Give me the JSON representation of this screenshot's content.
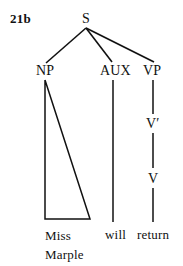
{
  "figure": {
    "example_number": "21b",
    "sentence": "Miss Marple will return",
    "ink_color": "#111111",
    "background_color": "#ffffff"
  },
  "tree": {
    "type": "phrase-structure-tree",
    "root": {
      "label": "S",
      "x": 86,
      "y": 18
    },
    "nodes": [
      {
        "id": "S",
        "label": "S",
        "x": 86,
        "y": 18,
        "level": 0
      },
      {
        "id": "NP",
        "label": "NP",
        "x": 45,
        "y": 70,
        "level": 1
      },
      {
        "id": "AUX",
        "label": "AUX",
        "x": 113,
        "y": 70,
        "level": 1
      },
      {
        "id": "VP",
        "label": "VP",
        "x": 153,
        "y": 70,
        "level": 1
      },
      {
        "id": "Vbar",
        "label": "V′",
        "x": 153,
        "y": 123,
        "level": 2
      },
      {
        "id": "V",
        "label": "V",
        "x": 153,
        "y": 178,
        "level": 3
      }
    ],
    "edges": [
      {
        "from": "S",
        "to": "NP"
      },
      {
        "from": "S",
        "to": "AUX"
      },
      {
        "from": "S",
        "to": "VP"
      },
      {
        "from": "AUX",
        "to": "will"
      },
      {
        "from": "VP",
        "to": "Vbar"
      },
      {
        "from": "Vbar",
        "to": "V"
      },
      {
        "from": "V",
        "to": "return"
      }
    ],
    "triangles": [
      {
        "parent": "NP",
        "apex_x": 45,
        "apex_y": 80,
        "base_left_x": 45,
        "base_right_x": 90,
        "base_y": 219,
        "covers": "Miss Marple"
      }
    ],
    "terminals": [
      {
        "id": "miss-marple",
        "lines": [
          "Miss",
          "Marple"
        ],
        "x": 45,
        "y": 227,
        "parent": "NP"
      },
      {
        "id": "will",
        "lines": [
          "will"
        ],
        "x": 105,
        "y": 227,
        "parent": "AUX"
      },
      {
        "id": "return",
        "lines": [
          "return"
        ],
        "x": 137,
        "y": 227,
        "parent": "V"
      }
    ]
  }
}
